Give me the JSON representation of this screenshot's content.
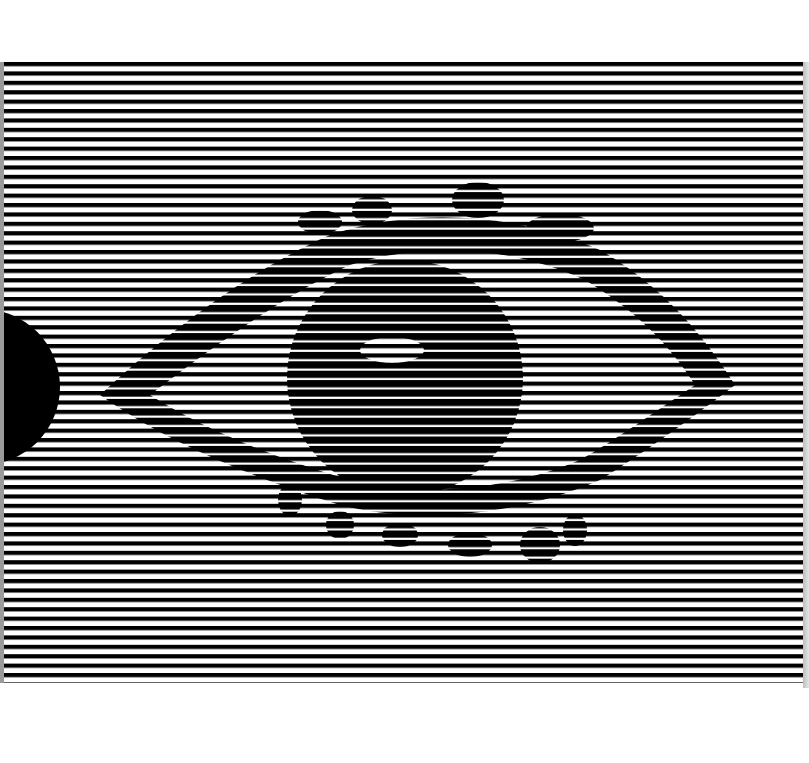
{
  "figure": {
    "background_color": "#ffffff",
    "stripe_color": "#000000",
    "stripe_region": {
      "x": 4,
      "y": 62,
      "width": 799,
      "height": 621
    },
    "stripe_period_px": 9.4,
    "stripe_thin_px": 4.2,
    "stripe_thick_px": 7.2,
    "hidden_shapes": [
      {
        "name": "eye-outline",
        "type": "almond"
      },
      {
        "name": "iris",
        "type": "circle",
        "cx": 405,
        "cy": 378,
        "r": 118
      },
      {
        "name": "pupil-highlight",
        "type": "ellipse",
        "cx": 390,
        "cy": 348,
        "rx": 30,
        "ry": 14
      },
      {
        "name": "upper-lashes",
        "type": "bumps"
      },
      {
        "name": "lower-lashes",
        "type": "bumps"
      }
    ],
    "solid_shape": {
      "name": "black-semicircle",
      "cx": -18,
      "cy": 387,
      "r": 78,
      "color": "#000000"
    }
  }
}
